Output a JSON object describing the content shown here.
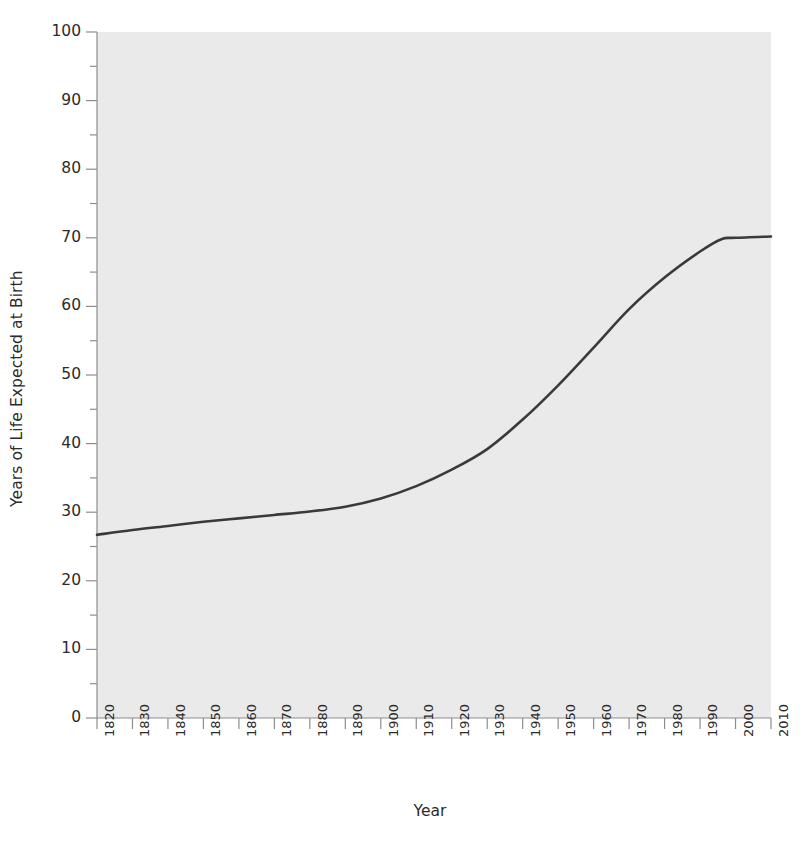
{
  "chart_data": {
    "type": "line",
    "title": "",
    "xlabel": "Year",
    "ylabel": "Years of Life Expected at Birth",
    "xlim": [
      1820,
      2010
    ],
    "ylim": [
      0,
      100
    ],
    "grid": false,
    "legend": null,
    "line_color": "#3a3a3a",
    "plot_background": "#eaeaea",
    "x_tick_labels": [
      "1820",
      "1830",
      "1840",
      "1850",
      "1860",
      "1870",
      "1880",
      "1890",
      "1900",
      "1910",
      "1920",
      "1930",
      "1940",
      "1950",
      "1960",
      "1970",
      "1980",
      "1990",
      "2000",
      "2010"
    ],
    "y_tick_labels": [
      "0",
      "10",
      "20",
      "30",
      "40",
      "50",
      "60",
      "70",
      "80",
      "90",
      "100"
    ],
    "y_minor_tick_step": 5,
    "series": [
      {
        "name": "Life expectancy at birth",
        "x": [
          1820,
          1830,
          1840,
          1850,
          1860,
          1870,
          1880,
          1890,
          1900,
          1910,
          1920,
          1930,
          1940,
          1950,
          1960,
          1970,
          1980,
          1990,
          1996,
          2000,
          2010
        ],
        "values": [
          26.7,
          27.4,
          28.0,
          28.6,
          29.1,
          29.6,
          30.1,
          30.8,
          32.0,
          33.8,
          36.2,
          39.2,
          43.5,
          48.5,
          54.0,
          59.6,
          64.2,
          68.0,
          69.8,
          70.0,
          70.2
        ]
      }
    ]
  }
}
